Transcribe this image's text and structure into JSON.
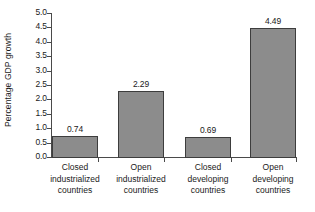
{
  "chart_data": {
    "type": "bar",
    "title": "",
    "xlabel": "",
    "ylabel": "Percentage GDP growth",
    "ylim": [
      0,
      5
    ],
    "ytick_step": 0.5,
    "grid": false,
    "legend": "none",
    "bar_color": "#8c8c8c",
    "bar_border_color": "#3d3d3d",
    "axis_color": "#4a4a4a",
    "categories": [
      "Closed industrialized countries",
      "Open industrialized countries",
      "Closed developing countries",
      "Open developing countries"
    ],
    "category_lines": [
      [
        "Closed",
        "industrialized",
        "countries"
      ],
      [
        "Open",
        "industrialized",
        "countries"
      ],
      [
        "Closed",
        "developing",
        "countries"
      ],
      [
        "Open",
        "developing",
        "countries"
      ]
    ],
    "values": [
      0.74,
      2.29,
      0.69,
      4.49
    ],
    "value_labels": [
      "0.74",
      "2.29",
      "0.69",
      "4.49"
    ],
    "ytick_labels": [
      "0.0",
      "0.5",
      "1.0",
      "1.5",
      "2.0",
      "2.5",
      "3.0",
      "3.5",
      "4.0",
      "4.5",
      "5.0"
    ]
  }
}
